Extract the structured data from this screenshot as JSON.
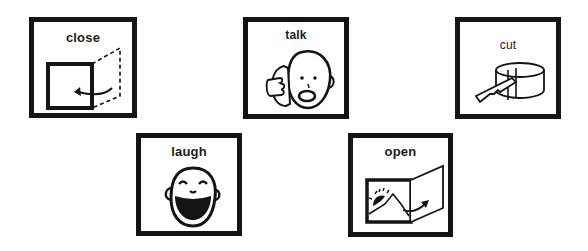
{
  "cards": [
    {
      "id": "close",
      "label": "close",
      "icon": "close-door-icon",
      "x": 29,
      "y": 17,
      "w": 108,
      "h": 101
    },
    {
      "id": "talk",
      "label": "talk",
      "icon": "phone-talk-icon",
      "x": 243,
      "y": 17,
      "w": 106,
      "h": 102
    },
    {
      "id": "cut",
      "label": "cut",
      "icon": "knife-cut-icon",
      "x": 455,
      "y": 17,
      "w": 106,
      "h": 102
    },
    {
      "id": "laugh",
      "label": "laugh",
      "icon": "laughing-face-icon",
      "x": 136,
      "y": 133,
      "w": 106,
      "h": 103
    },
    {
      "id": "open",
      "label": "open",
      "icon": "open-door-icon",
      "x": 348,
      "y": 133,
      "w": 105,
      "h": 104
    }
  ],
  "colors": {
    "ink": "#141414",
    "background": "#ffffff"
  }
}
